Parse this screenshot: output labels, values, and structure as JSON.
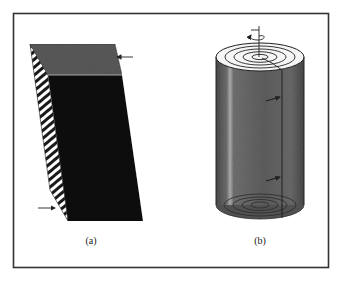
{
  "figure": {
    "panels": [
      {
        "id": "a",
        "label": "(a)",
        "subject": "sheared layered block",
        "arrows": [
          {
            "location": "top face, right edge",
            "direction": "left"
          },
          {
            "location": "bottom, left side",
            "direction": "right"
          }
        ]
      },
      {
        "id": "b",
        "label": "(b)",
        "subject": "twisted cylinder with concentric layers",
        "annotations": [
          {
            "type": "rotation-arrow",
            "location": "top axis"
          },
          {
            "type": "arrow",
            "location": "cylinder surface, upper"
          },
          {
            "type": "arrow",
            "location": "cylinder surface, lower"
          }
        ]
      }
    ],
    "colors": {
      "frame": "#333333",
      "block_front": "#111111",
      "block_top": "#5a5a5a",
      "cylinder_body": "#6b6b6b",
      "cylinder_top": "#f4f4f4"
    }
  }
}
